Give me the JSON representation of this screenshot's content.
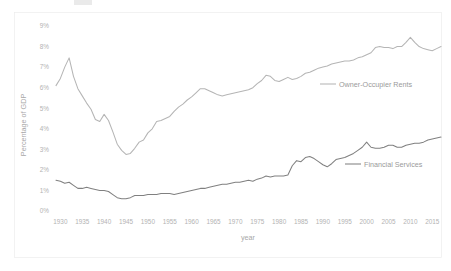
{
  "chart_data": {
    "type": "line",
    "title": "",
    "xlabel": "year",
    "ylabel": "Percentage of GDP",
    "xlim": [
      1929,
      2017
    ],
    "ylim": [
      0,
      9
    ],
    "grid": false,
    "legend_position": "inline-right",
    "x_tick_labels": [
      "1930",
      "1935",
      "1940",
      "1945",
      "1950",
      "1955",
      "1960",
      "1965",
      "1970",
      "1975",
      "1980",
      "1985",
      "1990",
      "1995",
      "2000",
      "2005",
      "2010",
      "2015"
    ],
    "x_ticks": [
      1930,
      1935,
      1940,
      1945,
      1950,
      1955,
      1960,
      1965,
      1970,
      1975,
      1980,
      1985,
      1990,
      1995,
      2000,
      2005,
      2010,
      2015
    ],
    "y_tick_labels": [
      "0%",
      "1%",
      "2%",
      "3%",
      "4%",
      "5%",
      "6%",
      "7%",
      "8%",
      "9%"
    ],
    "y_ticks": [
      0,
      1,
      2,
      3,
      4,
      5,
      6,
      7,
      8,
      9
    ],
    "x": [
      1929,
      1930,
      1931,
      1932,
      1933,
      1934,
      1935,
      1936,
      1937,
      1938,
      1939,
      1940,
      1941,
      1942,
      1943,
      1944,
      1945,
      1946,
      1947,
      1948,
      1949,
      1950,
      1951,
      1952,
      1953,
      1954,
      1955,
      1956,
      1957,
      1958,
      1959,
      1960,
      1961,
      1962,
      1963,
      1964,
      1965,
      1966,
      1967,
      1968,
      1969,
      1970,
      1971,
      1972,
      1973,
      1974,
      1975,
      1976,
      1977,
      1978,
      1979,
      1980,
      1981,
      1982,
      1983,
      1984,
      1985,
      1986,
      1987,
      1988,
      1989,
      1990,
      1991,
      1992,
      1993,
      1994,
      1995,
      1996,
      1997,
      1998,
      1999,
      2000,
      2001,
      2002,
      2003,
      2004,
      2005,
      2006,
      2007,
      2008,
      2009,
      2010,
      2011,
      2012,
      2013,
      2014,
      2015,
      2016,
      2017
    ],
    "series": [
      {
        "name": "Owner-Occupier Rents",
        "color": "#b5b5b5",
        "values": [
          6.1,
          6.45,
          7.0,
          7.45,
          6.55,
          5.95,
          5.6,
          5.25,
          4.95,
          4.45,
          4.35,
          4.7,
          4.4,
          3.85,
          3.25,
          2.95,
          2.75,
          2.8,
          3.05,
          3.35,
          3.45,
          3.8,
          4.0,
          4.35,
          4.4,
          4.5,
          4.6,
          4.85,
          5.05,
          5.2,
          5.4,
          5.55,
          5.75,
          5.95,
          5.95,
          5.85,
          5.75,
          5.65,
          5.6,
          5.65,
          5.7,
          5.75,
          5.8,
          5.85,
          5.9,
          6.0,
          6.2,
          6.35,
          6.6,
          6.55,
          6.35,
          6.3,
          6.4,
          6.5,
          6.4,
          6.45,
          6.55,
          6.7,
          6.75,
          6.85,
          6.95,
          7.0,
          7.05,
          7.15,
          7.2,
          7.25,
          7.3,
          7.3,
          7.35,
          7.45,
          7.5,
          7.6,
          7.7,
          7.95,
          8.0,
          7.95,
          7.95,
          7.9,
          8.0,
          8.0,
          8.2,
          8.45,
          8.2,
          8.0,
          7.9,
          7.85,
          7.8,
          7.9,
          8.0
        ]
      },
      {
        "name": "Financial Services",
        "color": "#808080",
        "values": [
          1.5,
          1.45,
          1.35,
          1.4,
          1.25,
          1.1,
          1.1,
          1.15,
          1.1,
          1.05,
          1.0,
          1.0,
          0.95,
          0.8,
          0.65,
          0.6,
          0.6,
          0.65,
          0.75,
          0.75,
          0.75,
          0.8,
          0.8,
          0.8,
          0.85,
          0.85,
          0.85,
          0.8,
          0.85,
          0.9,
          0.95,
          1.0,
          1.05,
          1.1,
          1.1,
          1.15,
          1.2,
          1.25,
          1.3,
          1.3,
          1.35,
          1.4,
          1.4,
          1.45,
          1.5,
          1.45,
          1.55,
          1.6,
          1.7,
          1.65,
          1.7,
          1.7,
          1.7,
          1.75,
          2.2,
          2.45,
          2.4,
          2.6,
          2.65,
          2.55,
          2.4,
          2.25,
          2.15,
          2.3,
          2.5,
          2.55,
          2.6,
          2.7,
          2.8,
          2.95,
          3.1,
          3.35,
          3.1,
          3.05,
          3.05,
          3.1,
          3.2,
          3.2,
          3.1,
          3.1,
          3.2,
          3.25,
          3.3,
          3.3,
          3.35,
          3.45,
          3.5,
          3.55,
          3.6
        ]
      }
    ],
    "annotations": [
      {
        "label": "Owner-Occupier Rents",
        "series": "Owner-Occupier Rents"
      },
      {
        "label": "Financial Services",
        "series": "Financial Services"
      }
    ]
  },
  "axes": {
    "y_title": "Percentage of GDP",
    "x_title": "year"
  },
  "colors": {
    "owner_occupier": "#b5b5b5",
    "financial_services": "#808080",
    "tick_text": "#b3b3b3",
    "axis_title": "#a8a8a8",
    "plot_border": "#ededed",
    "background": "#ffffff"
  }
}
